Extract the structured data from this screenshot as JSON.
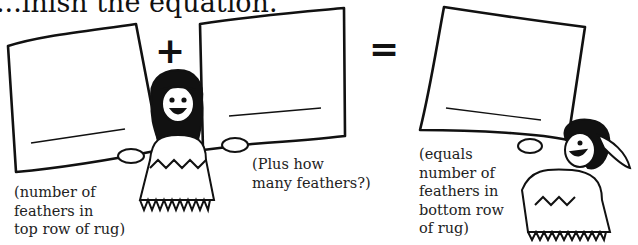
{
  "title": "...inish the equation.",
  "equation": {
    "plus_sign": "+",
    "equals_sign": "=",
    "box_1": {
      "answer_line": "",
      "caption": [
        "(number of",
        "feathers in",
        "top row of rug)"
      ]
    },
    "box_2": {
      "answer_line": "",
      "caption": [
        "(Plus how",
        "many feathers?)"
      ]
    },
    "box_3": {
      "answer_line": "",
      "caption": [
        "(equals",
        "number of",
        "feathers in",
        "bottom row",
        "of rug)"
      ]
    }
  },
  "illustrations": [
    "child-holding-signs",
    "child-holding-sign-with-headdress"
  ]
}
